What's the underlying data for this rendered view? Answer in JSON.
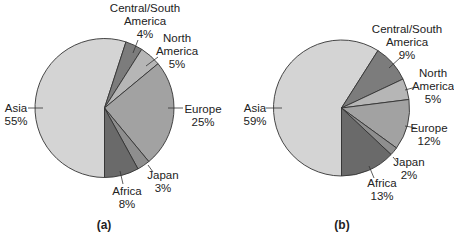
{
  "chart_data": [
    {
      "type": "pie",
      "panel_label": "(a)",
      "title": "",
      "start_angle_deg": 180,
      "direction": "clockwise",
      "categories": [
        "Asia",
        "Central/South America",
        "North America",
        "Europe",
        "Japan",
        "Africa"
      ],
      "values": [
        55,
        4,
        5,
        25,
        3,
        8
      ],
      "value_labels": [
        "55%",
        "4%",
        "5%",
        "25%",
        "3%",
        "8%"
      ],
      "colors": [
        "#d4d4d4",
        "#7c7c7c",
        "#b6b6b6",
        "#a2a2a2",
        "#8e8e8e",
        "#6a6a6a"
      ],
      "legend": "none (direct labels with leader lines)"
    },
    {
      "type": "pie",
      "panel_label": "(b)",
      "title": "",
      "start_angle_deg": 180,
      "direction": "clockwise",
      "categories": [
        "Asia",
        "Central/South America",
        "North America",
        "Europe",
        "Japan",
        "Africa"
      ],
      "values": [
        59,
        9,
        5,
        12,
        2,
        13
      ],
      "value_labels": [
        "59%",
        "9%",
        "5%",
        "12%",
        "2%",
        "13%"
      ],
      "colors": [
        "#d4d4d4",
        "#7c7c7c",
        "#b6b6b6",
        "#a2a2a2",
        "#8e8e8e",
        "#6a6a6a"
      ],
      "legend": "none (direct labels with leader lines)"
    }
  ],
  "labels": {
    "a": {
      "asia": [
        "Asia",
        "55%"
      ],
      "csa": [
        "Central/South",
        "America",
        "4%"
      ],
      "na": [
        "North",
        "America",
        "5%"
      ],
      "europe": [
        "Europe",
        "25%"
      ],
      "japan": [
        "Japan",
        "3%"
      ],
      "africa": [
        "Africa",
        "8%"
      ],
      "panel": "(a)"
    },
    "b": {
      "asia": [
        "Asia",
        "59%"
      ],
      "csa": [
        "Central/South",
        "America",
        "9%"
      ],
      "na": [
        "North",
        "America",
        "5%"
      ],
      "europe": [
        "Europe",
        "12%"
      ],
      "japan": [
        "Japan",
        "2%"
      ],
      "africa": [
        "Africa",
        "13%"
      ],
      "panel": "(b)"
    }
  }
}
